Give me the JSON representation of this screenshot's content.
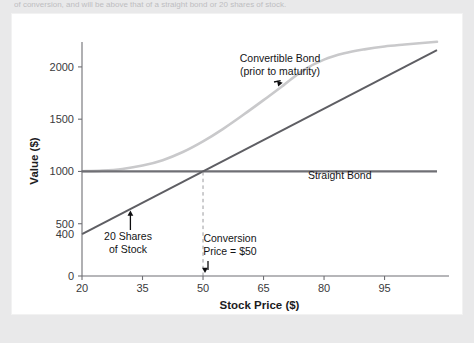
{
  "page": {
    "caption_fragment": "of conversion, and will be above that of a straight bond or 20 shares of stock."
  },
  "chart_data": {
    "type": "line",
    "title": "",
    "xlabel": "Stock Price ($)",
    "ylabel": "Value ($)",
    "xlim": [
      20,
      108
    ],
    "ylim": [
      0,
      2200
    ],
    "xticks": [
      20,
      35,
      50,
      65,
      80,
      95
    ],
    "xticklabels": [
      "20",
      "35",
      "50",
      "65",
      "80",
      "95"
    ],
    "yticks": [
      0,
      400,
      500,
      1000,
      1500,
      2000
    ],
    "yticklabels": [
      "0",
      "400",
      "500",
      "1000",
      "1500",
      "2000"
    ],
    "grid": false,
    "legend": "none",
    "series": [
      {
        "name": "Straight Bond",
        "type": "line",
        "color": "#6f6f74",
        "x": [
          20,
          108
        ],
        "values": [
          1000,
          1000
        ]
      },
      {
        "name": "20 Shares of Stock",
        "type": "line",
        "color": "#5e5e63",
        "x": [
          20,
          108
        ],
        "values": [
          400,
          2160
        ]
      },
      {
        "name": "Convertible Bond (prior to maturity)",
        "type": "line",
        "color": "#c9c9cb",
        "x": [
          20,
          25,
          30,
          35,
          40,
          45,
          50,
          55,
          60,
          65,
          70,
          75,
          80,
          85,
          90,
          95,
          100,
          108
        ],
        "values": [
          1002,
          1008,
          1024,
          1056,
          1108,
          1186,
          1288,
          1408,
          1542,
          1682,
          1826,
          1972,
          2070,
          2130,
          2168,
          2196,
          2214,
          2240
        ]
      }
    ],
    "annotations": [
      {
        "name": "convertible-bond-annotation",
        "text_line1": "Convertible Bond",
        "text_line2": "(prior to maturity)",
        "points_to_x": 70,
        "points_to_y": 1830
      },
      {
        "name": "straight-bond-annotation",
        "text_line1": "Straight Bond",
        "at_x": 76,
        "at_y": 930
      },
      {
        "name": "shares-annotation",
        "text_line1": "20 Shares",
        "text_line2": "of Stock",
        "points_to_x": 32,
        "points_to_y": 645
      },
      {
        "name": "conversion-price-annotation",
        "text_line1": "Conversion",
        "text_line2": "Price = $50",
        "points_to_x": 50,
        "points_to_y": 0
      }
    ],
    "reference_lines": [
      {
        "name": "conversion-price-dashed-line",
        "orientation": "vertical",
        "x": 50,
        "from_y": 0,
        "to_y": 1000
      }
    ]
  }
}
